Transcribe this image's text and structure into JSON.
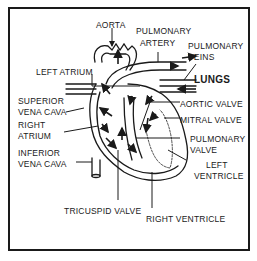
{
  "diagram": {
    "type": "anatomical-heart",
    "labels": {
      "aorta": "AORTA",
      "pulmonary_artery_1": "PULMONARY",
      "pulmonary_artery_2": "ARTERY",
      "pulmonary_veins_1": "PULMONARY",
      "pulmonary_veins_2": "VEINS",
      "lungs": "LUNGS",
      "left_atrium": "LEFT ATRIUM",
      "superior_vena_cava_1": "SUPERIOR",
      "superior_vena_cava_2": "VENA CAVA",
      "right_atrium_1": "RIGHT",
      "right_atrium_2": "ATRIUM",
      "aortic_valve": "AORTIC VALVE",
      "mitral_valve": "MITRAL VALVE",
      "inferior_vena_cava_1": "INFERIOR",
      "inferior_vena_cava_2": "VENA CAVA",
      "pulmonary_valve_1": "PULMONARY",
      "pulmonary_valve_2": "VALVE",
      "left_ventricle_1": "LEFT",
      "left_ventricle_2": "VENTRICLE",
      "tricuspid_valve": "TRICUSPID VALVE",
      "right_ventricle": "RIGHT VENTRICLE"
    },
    "colors": {
      "ink": "#1a1a1a",
      "background": "#ffffff"
    }
  }
}
